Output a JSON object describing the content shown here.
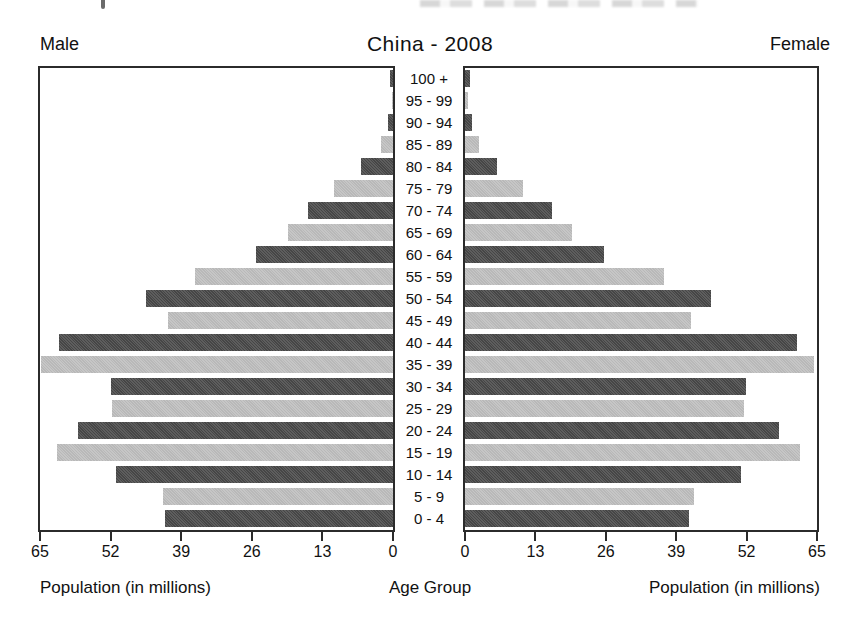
{
  "page": {
    "title": "China - 2008",
    "male_label": "Male",
    "female_label": "Female",
    "left_axis_caption": "Population (in millions)",
    "center_axis_caption": "Age Group",
    "right_axis_caption": "Population (in millions)"
  },
  "chart_data": {
    "type": "bar",
    "subtype": "population-pyramid",
    "title": "China - 2008",
    "categories_top_to_bottom": [
      "100 +",
      "95 - 99",
      "90 - 94",
      "85 - 89",
      "80 - 84",
      "75 - 79",
      "70 - 74",
      "65 - 69",
      "60 - 64",
      "55 - 59",
      "50 - 54",
      "45 - 49",
      "40 - 44",
      "35 - 39",
      "30 - 34",
      "25 - 29",
      "20 - 24",
      "15 - 19",
      "10 - 14",
      "5 - 9",
      "0 - 4"
    ],
    "series": [
      {
        "name": "Male",
        "side": "left",
        "values": [
          0.6,
          0.2,
          1.0,
          2.3,
          5.9,
          10.9,
          15.7,
          19.4,
          25.2,
          36.5,
          45.4,
          41.4,
          61.5,
          64.8,
          51.9,
          51.8,
          58.0,
          61.9,
          51.0,
          42.3,
          42.0
        ]
      },
      {
        "name": "Female",
        "side": "right",
        "values": [
          0.9,
          0.6,
          1.3,
          2.5,
          5.9,
          10.8,
          16.0,
          19.7,
          25.6,
          36.8,
          45.4,
          41.7,
          61.3,
          64.4,
          51.8,
          51.6,
          58.0,
          61.9,
          51.0,
          42.3,
          41.4
        ]
      }
    ],
    "x_axis": {
      "unit": "millions",
      "max": 65,
      "left_ticks": [
        "65",
        "52",
        "39",
        "26",
        "13",
        "0"
      ],
      "right_ticks": [
        "0",
        "13",
        "26",
        "39",
        "52",
        "65"
      ]
    },
    "xlabel": "Population (in millions)",
    "ylabel": "Age Group",
    "grid": false,
    "legend": "none",
    "bar_color_pattern": "rows alternate dark/light starting dark at 100 +",
    "colors": {
      "dark_bar": "#4e4e4e",
      "light_bar": "#c4c4c4",
      "axis": "#2b2b2b"
    }
  }
}
